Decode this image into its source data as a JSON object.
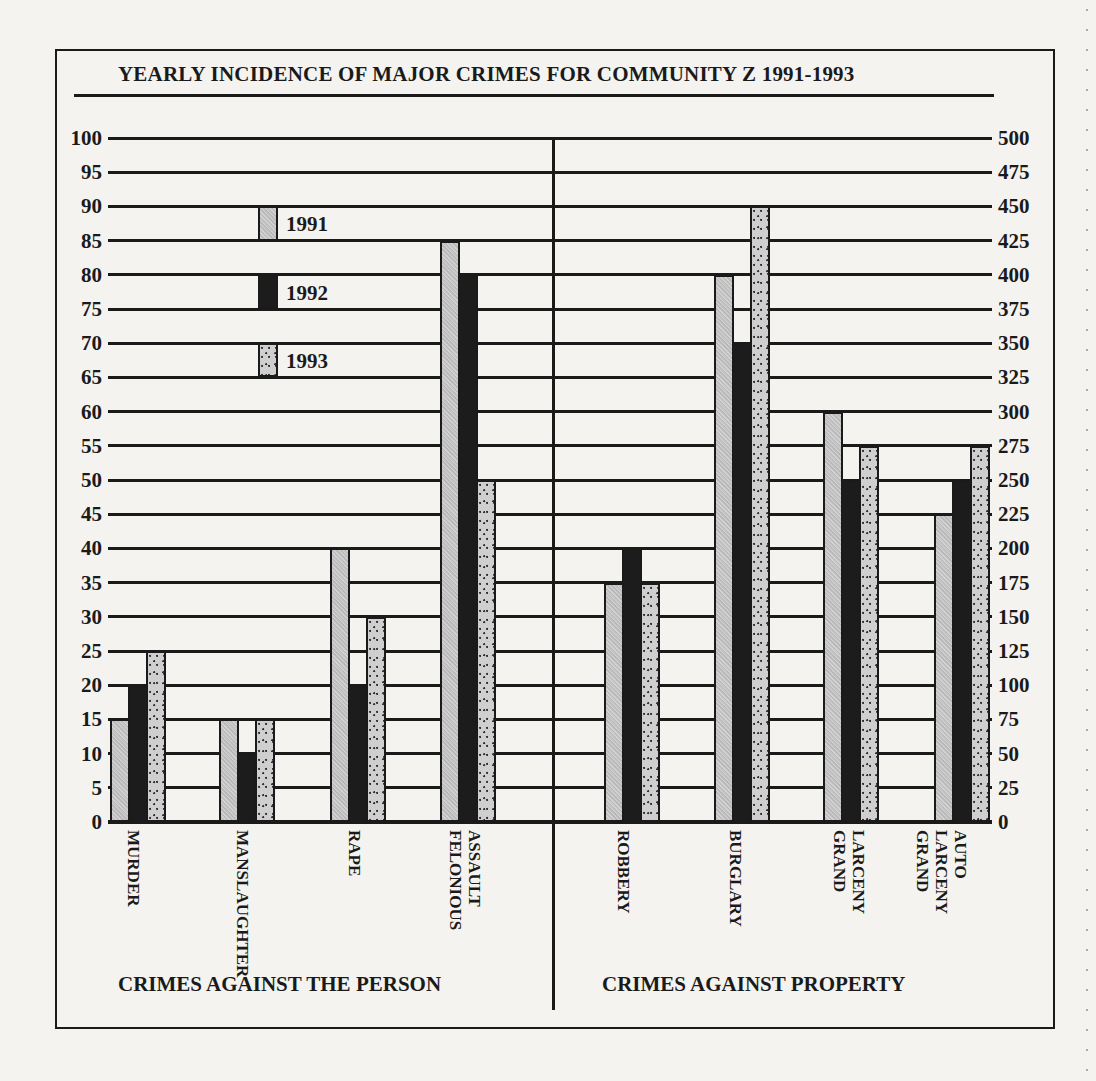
{
  "chart_data": {
    "type": "bar",
    "title": "YEARLY INCIDENCE OF MAJOR CRIMES FOR COMMUNITY Z 1991-1993",
    "legend": [
      "1991",
      "1992",
      "1993"
    ],
    "legend_position": "upper-left inside plot",
    "grid": true,
    "panels": [
      {
        "group_label": "CRIMES AGAINST THE PERSON",
        "axis": "left",
        "ylim": [
          0,
          100
        ],
        "yticks": [
          0,
          5,
          10,
          15,
          20,
          25,
          30,
          35,
          40,
          45,
          50,
          55,
          60,
          65,
          70,
          75,
          80,
          85,
          90,
          95,
          100
        ],
        "categories": [
          "MURDER",
          "MANSLAUGHTER",
          "RAPE",
          "FELONIOUS ASSAULT"
        ],
        "series": [
          {
            "name": "1991",
            "values": [
              15,
              15,
              40,
              85
            ]
          },
          {
            "name": "1992",
            "values": [
              20,
              10,
              20,
              80
            ]
          },
          {
            "name": "1993",
            "values": [
              25,
              15,
              30,
              50
            ]
          }
        ]
      },
      {
        "group_label": "CRIMES AGAINST PROPERTY",
        "axis": "right",
        "ylim": [
          0,
          500
        ],
        "yticks": [
          0,
          25,
          50,
          75,
          100,
          125,
          150,
          175,
          200,
          225,
          250,
          275,
          300,
          325,
          350,
          375,
          400,
          425,
          450,
          475,
          500
        ],
        "categories": [
          "ROBBERY",
          "BURGLARY",
          "GRAND LARCENY",
          "GRAND LARCENY AUTO"
        ],
        "series": [
          {
            "name": "1991",
            "values": [
              175,
              400,
              300,
              225
            ]
          },
          {
            "name": "1992",
            "values": [
              200,
              350,
              250,
              250
            ]
          },
          {
            "name": "1993",
            "values": [
              175,
              450,
              275,
              275
            ]
          }
        ]
      }
    ],
    "xlabel": "",
    "ylabel_left": "",
    "ylabel_right": ""
  },
  "labels": {
    "title": "YEARLY INCIDENCE OF MAJOR CRIMES FOR COMMUNITY Z 1991-1993",
    "group_person": "CRIMES AGAINST THE PERSON",
    "group_property": "CRIMES AGAINST PROPERTY",
    "legend_1991": "1991",
    "legend_1992": "1992",
    "legend_1993": "1993",
    "cat_murder": "MURDER",
    "cat_manslaughter": "MANSLAUGHTER",
    "cat_rape": "RAPE",
    "cat_felonious_assault": "FELONIOUS\nASSAULT",
    "cat_robbery": "ROBBERY",
    "cat_burglary": "BURGLARY",
    "cat_grand_larceny": "GRAND\nLARCENY",
    "cat_grand_larceny_auto": "GRAND\nLARCENY\nAUTO"
  },
  "colors": {
    "ink": "#1a1a1a",
    "paper": "#f4f3f0",
    "bar_1991": "#c4c4c4",
    "bar_1992": "#1c1c1c",
    "bar_1993": "#cfcfcf"
  }
}
